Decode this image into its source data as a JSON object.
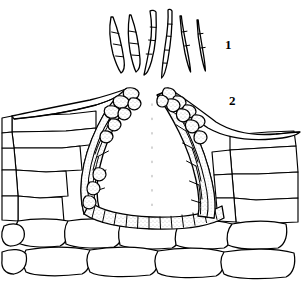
{
  "figure": {
    "domain_note": "line drawing, black ink on white",
    "background_color": "#ffffff",
    "ink_color": "#000000",
    "stipple_color": "#9a9a9a",
    "width": 301,
    "height": 290,
    "panels": [
      {
        "id": "panel-1",
        "label": "1",
        "label_x": 225,
        "label_y": 38,
        "caption": "Conidia",
        "description": "Six falcate septate conidia arranged in a fan",
        "spore_count": 6,
        "spores": [
          {
            "index": 1,
            "septa": 3,
            "length": 62,
            "curvature": "strong left-curving"
          },
          {
            "index": 2,
            "septa": 3,
            "length": 60,
            "curvature": "moderate left-curving"
          },
          {
            "index": 3,
            "septa": 3,
            "length": 70,
            "curvature": "sigmoid"
          },
          {
            "index": 4,
            "septa": 4,
            "length": 72,
            "curvature": "sigmoid"
          },
          {
            "index": 5,
            "septa": 2,
            "length": 58,
            "curvature": "slight right-curving"
          },
          {
            "index": 6,
            "septa": 2,
            "length": 52,
            "curvature": "slight right-curving"
          }
        ]
      },
      {
        "id": "panel-2",
        "label": "2",
        "label_x": 229,
        "label_y": 94,
        "caption": "Acervulus in host tissue",
        "description": "Cross-section of an acervulus erupting through the ruptured cuticle and epidermis, lined with stippled fungal cells, surrounded by host parenchyma cells",
        "parts": [
          {
            "name": "ruptured-cuticle-left",
            "kind": "host-cuticle"
          },
          {
            "name": "ruptured-cuticle-right",
            "kind": "host-cuticle"
          },
          {
            "name": "fungal-cell-layer",
            "kind": "acervulus-lining"
          },
          {
            "name": "acervulus-cavity",
            "kind": "cavity"
          },
          {
            "name": "host-epidermal-cells",
            "kind": "host-tissue"
          },
          {
            "name": "host-parenchyma-cells",
            "kind": "host-tissue"
          },
          {
            "name": "centerline",
            "kind": "dotted-axis"
          }
        ]
      }
    ]
  }
}
